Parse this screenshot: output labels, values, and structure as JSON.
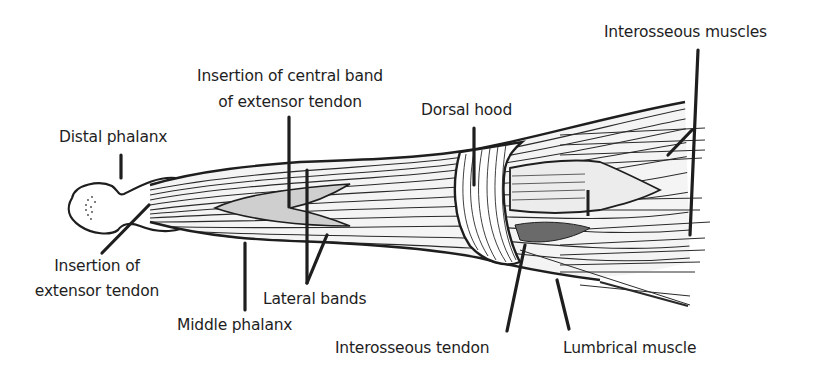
{
  "diagram": {
    "colors": {
      "background": "#ffffff",
      "ink": "#1e1e1e"
    },
    "labels": {
      "interosseous_muscles": "Interosseous muscles",
      "central_band_line1": "Insertion of central band",
      "central_band_line2": "of extensor tendon",
      "dorsal_hood": "Dorsal hood",
      "distal_phalanx": "Distal phalanx",
      "insertion_extensor_line1": "Insertion of",
      "insertion_extensor_line2": "extensor tendon",
      "lateral_bands": "Lateral bands",
      "middle_phalanx": "Middle phalanx",
      "interosseous_tendon": "Interosseous tendon",
      "lumbrical_muscle": "Lumbrical muscle"
    }
  }
}
